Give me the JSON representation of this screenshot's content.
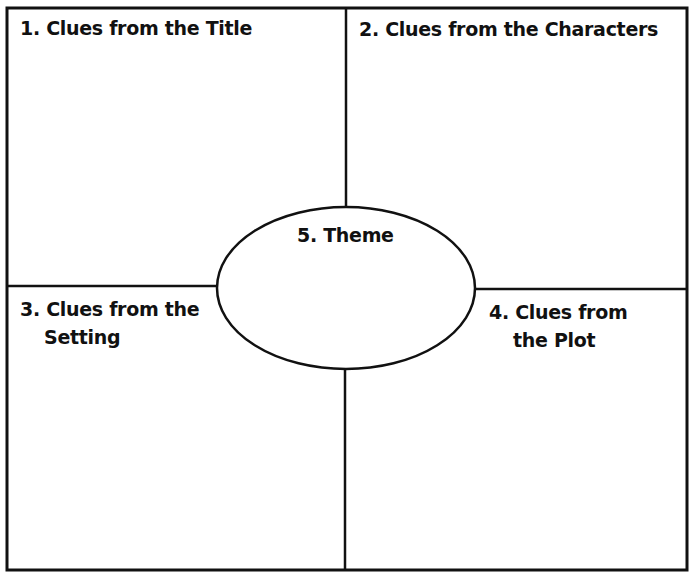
{
  "diagram": {
    "type": "four-square graphic organizer with central oval",
    "colors": {
      "line": "#111111",
      "background": "#ffffff",
      "text": "#111111"
    },
    "quadrants": [
      {
        "number": 1,
        "label": "1. Clues from the Title",
        "position": "top-left"
      },
      {
        "number": 2,
        "label": "2. Clues from the Characters",
        "position": "top-right"
      },
      {
        "number": 3,
        "label_line1": "3. Clues from the",
        "label_line2": "Setting",
        "position": "bottom-left"
      },
      {
        "number": 4,
        "label_line1": "4. Clues from",
        "label_line2": "the Plot",
        "position": "bottom-right"
      }
    ],
    "center": {
      "number": 5,
      "label": "5. Theme",
      "shape": "ellipse"
    }
  }
}
